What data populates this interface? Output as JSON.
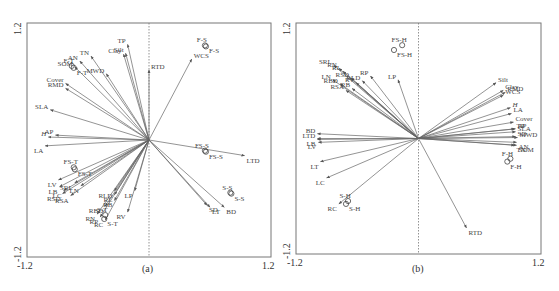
{
  "figure": {
    "panels": [
      {
        "id": "a",
        "caption": "(a)"
      },
      {
        "id": "b",
        "caption": "(b)"
      }
    ]
  },
  "chart_data": [
    {
      "type": "scatter",
      "subtype": "biplot",
      "title": "(a)",
      "xlim": [
        -1.2,
        1.2
      ],
      "ylim": [
        -1.2,
        1.2
      ],
      "x_tick_labels": [
        "-1.2",
        "1.2"
      ],
      "y_tick_labels": [
        "-1.2",
        "1.2"
      ],
      "grid": false,
      "zero_line": "vertical dashed at x=0",
      "vectors": [
        {
          "name": "TP",
          "x": -0.21,
          "y": 0.98
        },
        {
          "name": "Clay",
          "x": -0.25,
          "y": 0.88
        },
        {
          "name": "Silt",
          "x": -0.23,
          "y": 0.89
        },
        {
          "name": "RTD",
          "x": 0.0,
          "y": 0.72
        },
        {
          "name": "MWD",
          "x": -0.42,
          "y": 0.68
        },
        {
          "name": "TN",
          "x": -0.57,
          "y": 0.86
        },
        {
          "name": "AN",
          "x": -0.68,
          "y": 0.81
        },
        {
          "name": "SOM",
          "x": -0.73,
          "y": 0.75
        },
        {
          "name": "Cover",
          "x": -0.82,
          "y": 0.58
        },
        {
          "name": "RMD",
          "x": -0.82,
          "y": 0.53
        },
        {
          "name": "SLA",
          "x": -0.97,
          "y": 0.31
        },
        {
          "name": "AP",
          "x": -0.92,
          "y": 0.05
        },
        {
          "name": "H",
          "x": -0.99,
          "y": 0.03
        },
        {
          "name": "LA",
          "x": -1.02,
          "y": -0.06
        },
        {
          "name": "WCS",
          "x": 0.42,
          "y": 0.83
        },
        {
          "name": "LTD",
          "x": 0.94,
          "y": -0.16
        },
        {
          "name": "BD",
          "x": 0.74,
          "y": -0.69
        },
        {
          "name": "LT",
          "x": 0.6,
          "y": -0.69
        },
        {
          "name": "SD",
          "x": 0.57,
          "y": -0.67
        },
        {
          "name": "LV",
          "x": -0.89,
          "y": -0.41
        },
        {
          "name": "LB",
          "x": -0.88,
          "y": -0.48
        },
        {
          "name": "LC",
          "x": -0.84,
          "y": -0.52
        },
        {
          "name": "RSD",
          "x": -0.85,
          "y": -0.55
        },
        {
          "name": "SRL",
          "x": -0.73,
          "y": -0.44
        },
        {
          "name": "LN",
          "x": -0.67,
          "y": -0.47
        },
        {
          "name": "RSA",
          "x": -0.77,
          "y": -0.57
        },
        {
          "name": "RLD",
          "x": -0.34,
          "y": -0.52
        },
        {
          "name": "RL",
          "x": -0.34,
          "y": -0.56
        },
        {
          "name": "RBD",
          "x": -0.43,
          "y": -0.68
        },
        {
          "name": "RB",
          "x": -0.34,
          "y": -0.62
        },
        {
          "name": "RN",
          "x": -0.51,
          "y": -0.76
        },
        {
          "name": "RP",
          "x": -0.48,
          "y": -0.79
        },
        {
          "name": "RC",
          "x": -0.43,
          "y": -0.82
        },
        {
          "name": "LP",
          "x": -0.14,
          "y": -0.52
        },
        {
          "name": "RV",
          "x": -0.21,
          "y": -0.74
        }
      ],
      "points": [
        {
          "name": "F-S",
          "x": 0.55,
          "y": 0.97
        },
        {
          "name": "F-S",
          "x": 0.56,
          "y": 0.96
        },
        {
          "name": "F-T",
          "x": -0.76,
          "y": 0.76
        },
        {
          "name": "F-T",
          "x": -0.74,
          "y": 0.74
        },
        {
          "name": "FS-S",
          "x": 0.55,
          "y": -0.11
        },
        {
          "name": "FS-S",
          "x": 0.56,
          "y": -0.12
        },
        {
          "name": "FS-T",
          "x": -0.74,
          "y": -0.28
        },
        {
          "name": "FS-T",
          "x": -0.73,
          "y": -0.3
        },
        {
          "name": "S-S",
          "x": 0.8,
          "y": -0.54
        },
        {
          "name": "S-S",
          "x": 0.81,
          "y": -0.55
        },
        {
          "name": "S-T",
          "x": -0.43,
          "y": -0.77
        },
        {
          "name": "S-T",
          "x": -0.44,
          "y": -0.81
        }
      ]
    },
    {
      "type": "scatter",
      "subtype": "biplot",
      "title": "(b)",
      "xlim": [
        -1.2,
        1.2
      ],
      "ylim": [
        -1.2,
        1.2
      ],
      "x_tick_labels": [
        "-1.2",
        "1.2"
      ],
      "y_tick_labels": [
        "-1.2",
        "1.2"
      ],
      "grid": false,
      "zero_line": "vertical dashed at x=0",
      "vectors": [
        {
          "name": "SRL",
          "x": -0.83,
          "y": 0.76
        },
        {
          "name": "RN",
          "x": -0.78,
          "y": 0.73
        },
        {
          "name": "RL",
          "x": -0.74,
          "y": 0.7
        },
        {
          "name": "LN",
          "x": -0.84,
          "y": 0.61
        },
        {
          "name": "RSD",
          "x": -0.66,
          "y": 0.63
        },
        {
          "name": "RBD",
          "x": -0.77,
          "y": 0.57
        },
        {
          "name": "RV",
          "x": -0.61,
          "y": 0.58
        },
        {
          "name": "RB",
          "x": -0.65,
          "y": 0.52
        },
        {
          "name": "RSA",
          "x": -0.71,
          "y": 0.5
        },
        {
          "name": "RLD",
          "x": -0.55,
          "y": 0.6
        },
        {
          "name": "RP",
          "x": -0.47,
          "y": 0.65
        },
        {
          "name": "LP",
          "x": -0.2,
          "y": 0.61
        },
        {
          "name": "Silt",
          "x": 0.76,
          "y": 0.58
        },
        {
          "name": "Clay",
          "x": 0.83,
          "y": 0.5
        },
        {
          "name": "RMD",
          "x": 0.85,
          "y": 0.48
        },
        {
          "name": "WCS",
          "x": 0.83,
          "y": 0.45
        },
        {
          "name": "H",
          "x": 0.9,
          "y": 0.32
        },
        {
          "name": "LA",
          "x": 0.91,
          "y": 0.26
        },
        {
          "name": "Cover",
          "x": 0.93,
          "y": 0.17
        },
        {
          "name": "TP",
          "x": 0.94,
          "y": 0.1
        },
        {
          "name": "AP",
          "x": 0.95,
          "y": 0.1
        },
        {
          "name": "SLA",
          "x": 0.95,
          "y": 0.07
        },
        {
          "name": "SD",
          "x": 0.95,
          "y": 0.02
        },
        {
          "name": "MWD",
          "x": 0.97,
          "y": 0.01
        },
        {
          "name": "AN",
          "x": 0.96,
          "y": -0.04
        },
        {
          "name": "SOM",
          "x": 0.96,
          "y": -0.07
        },
        {
          "name": "TN",
          "x": 0.94,
          "y": -0.07
        },
        {
          "name": "BD",
          "x": -0.99,
          "y": 0.05
        },
        {
          "name": "LTD",
          "x": -0.99,
          "y": 0.0
        },
        {
          "name": "LB",
          "x": -0.99,
          "y": -0.01
        },
        {
          "name": "LV",
          "x": -0.98,
          "y": -0.04
        },
        {
          "name": "LT",
          "x": -0.96,
          "y": -0.24
        },
        {
          "name": "LC",
          "x": -0.9,
          "y": -0.41
        },
        {
          "name": "RC",
          "x": -0.78,
          "y": -0.68
        },
        {
          "name": "RTD",
          "x": 0.47,
          "y": -0.93
        }
      ],
      "points": [
        {
          "name": "FS-H",
          "x": -0.16,
          "y": 0.97
        },
        {
          "name": "FS-H",
          "x": -0.24,
          "y": 0.92
        },
        {
          "name": "F-H",
          "x": 0.9,
          "y": -0.21
        },
        {
          "name": "F-H",
          "x": 0.87,
          "y": -0.24
        },
        {
          "name": "S-H",
          "x": -0.69,
          "y": -0.65
        },
        {
          "name": "S-H",
          "x": -0.71,
          "y": -0.68
        }
      ]
    }
  ]
}
